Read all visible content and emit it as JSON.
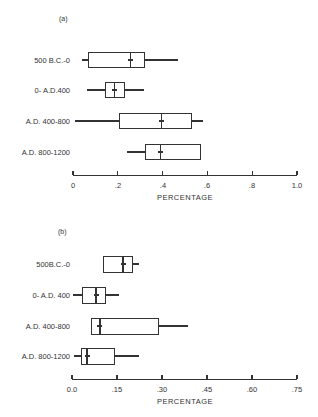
{
  "chart_data": [
    {
      "type": "boxplot",
      "panel": "(a)",
      "xlabel": "PERCENTAGE",
      "xlim": [
        0,
        1.0
      ],
      "xticks": [
        "0",
        ".2",
        ".4",
        ".6",
        ".8",
        "1.0"
      ],
      "xtick_values": [
        0,
        0.2,
        0.4,
        0.6,
        0.8,
        1.0
      ],
      "categories": [
        "500 B.C.-0",
        "0- A.D.400",
        "A.D. 400-800",
        "A.D. 800-1200"
      ],
      "series": [
        {
          "name": "500 B.C.-0",
          "min": 0.04,
          "q1": 0.067,
          "median": 0.255,
          "q3": 0.32,
          "max": 0.47
        },
        {
          "name": "0- A.D.400",
          "min": 0.063,
          "q1": 0.143,
          "median": 0.184,
          "q3": 0.232,
          "max": 0.317
        },
        {
          "name": "A.D. 400-800",
          "min": 0.01,
          "q1": 0.205,
          "median": 0.395,
          "q3": 0.53,
          "max": 0.58
        },
        {
          "name": "A.D. 800-1200",
          "min": 0.24,
          "q1": 0.32,
          "median": 0.39,
          "q3": 0.57,
          "max": 0.57
        }
      ],
      "grid": false
    },
    {
      "type": "boxplot",
      "panel": "(b)",
      "xlabel": "PERCENTAGE",
      "xlim": [
        0,
        0.75
      ],
      "xticks": [
        "0.0",
        ".15",
        ".30",
        ".45",
        ".60",
        ".75"
      ],
      "xtick_values": [
        0,
        0.15,
        0.3,
        0.45,
        0.6,
        0.75
      ],
      "categories": [
        "500B.C.-0",
        "0- A.D. 400",
        "A.D. 400-800",
        "A.D. 800-1200"
      ],
      "series": [
        {
          "name": "500B.C.-0",
          "min": 0.103,
          "q1": 0.103,
          "median": 0.17,
          "q3": 0.203,
          "max": 0.223
        },
        {
          "name": "0- A.D. 400",
          "min": 0.003,
          "q1": 0.033,
          "median": 0.08,
          "q3": 0.113,
          "max": 0.157
        },
        {
          "name": "A.D. 400-800",
          "min": 0.063,
          "q1": 0.063,
          "median": 0.093,
          "q3": 0.29,
          "max": 0.387
        },
        {
          "name": "A.D. 800-1200",
          "min": 0.007,
          "q1": 0.03,
          "median": 0.05,
          "q3": 0.143,
          "max": 0.223
        }
      ],
      "grid": false
    }
  ],
  "panels": [
    {
      "label": "(a)",
      "rows": [
        "500 B.C.-0",
        "0- A.D.400",
        "A.D. 400-800",
        "A.D. 800-1200"
      ],
      "ticks": [
        "0",
        ".2",
        ".4",
        ".6",
        ".8",
        "1.0"
      ],
      "axis_title": "PERCENTAGE"
    },
    {
      "label": "(b)",
      "rows": [
        "500B.C.-0",
        "0- A.D. 400",
        "A.D. 400-800",
        "A.D. 800-1200"
      ],
      "ticks": [
        "0.0",
        ".15",
        ".30",
        ".45",
        ".60",
        ".75"
      ],
      "axis_title": "PERCENTAGE"
    }
  ]
}
